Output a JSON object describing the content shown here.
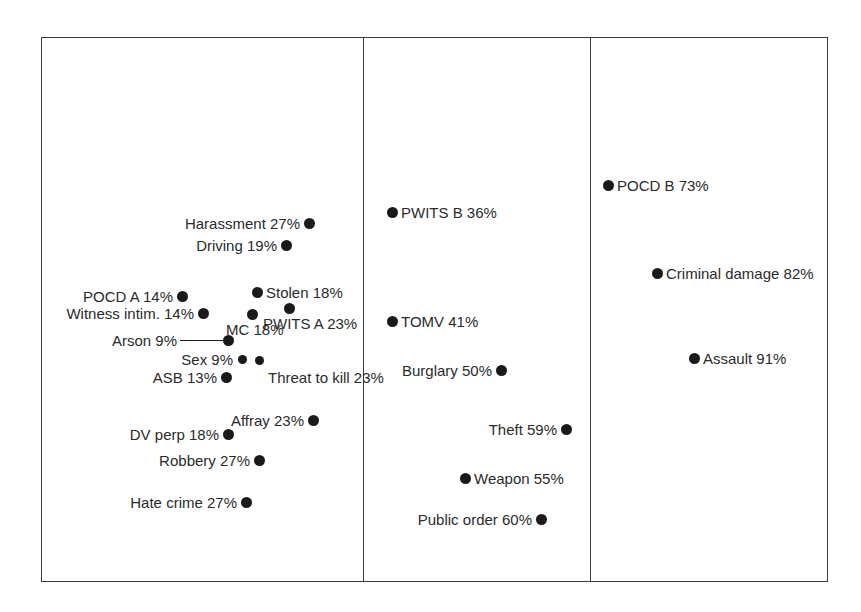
{
  "figure": {
    "background_color": "#ffffff",
    "frame_color": "#3b3b3b",
    "marker_color": "#1a1a1a",
    "text_color": "#2b2b2b"
  },
  "chart_data": {
    "type": "scatter",
    "title": "",
    "subtitle": "",
    "xlabel": "",
    "ylabel": "",
    "grid": false,
    "legend": "none",
    "panels": 3,
    "panel_dividers_x": [
      363,
      590
    ],
    "value_unit": "%",
    "note": "Labelled scatter of offence types against a percentage value; three vertical bands group low, medium and high percentages.",
    "points": [
      {
        "label": "Harassment 27%",
        "name": "Harassment",
        "value": 27,
        "panel": 1,
        "x": 309,
        "y": 223,
        "label_side": "left"
      },
      {
        "label": "Driving 19%",
        "name": "Driving",
        "value": 19,
        "panel": 1,
        "x": 286,
        "y": 245,
        "label_side": "left"
      },
      {
        "label": "POCD A 14%",
        "name": "POCD A",
        "value": 14,
        "panel": 1,
        "x": 182,
        "y": 296,
        "label_side": "left"
      },
      {
        "label": "Stolen 18%",
        "name": "Stolen",
        "value": 18,
        "panel": 1,
        "x": 257,
        "y": 292,
        "label_side": "right"
      },
      {
        "label": "Witness intim. 14%",
        "name": "Witness intim.",
        "value": 14,
        "panel": 1,
        "x": 203,
        "y": 313,
        "label_side": "left"
      },
      {
        "label": "PWITS A 23%",
        "name": "PWITS A",
        "value": 23,
        "panel": 1,
        "x": 289,
        "y": 308,
        "label_side": "below"
      },
      {
        "label": "MC 18%",
        "name": "MC",
        "value": 18,
        "panel": 1,
        "x": 252,
        "y": 314,
        "label_side": "below"
      },
      {
        "label": "Arson 9%",
        "name": "Arson",
        "value": 9,
        "panel": 1,
        "x": 228,
        "y": 340,
        "label_side": "leader"
      },
      {
        "label": "Sex 9%",
        "name": "Sex",
        "value": 9,
        "panel": 1,
        "x": 242,
        "y": 359,
        "label_side": "left"
      },
      {
        "label": "Threat to kill 23%",
        "name": "Threat to kill",
        "value": 23,
        "panel": 1,
        "x": 259,
        "y": 360,
        "label_side": "below-right"
      },
      {
        "label": "ASB 13%",
        "name": "ASB",
        "value": 13,
        "panel": 1,
        "x": 226,
        "y": 377,
        "label_side": "left"
      },
      {
        "label": "Affray 23%",
        "name": "Affray",
        "value": 23,
        "panel": 1,
        "x": 313,
        "y": 420,
        "label_side": "left"
      },
      {
        "label": "DV perp 18%",
        "name": "DV perp",
        "value": 18,
        "panel": 1,
        "x": 228,
        "y": 434,
        "label_side": "left"
      },
      {
        "label": "Robbery 27%",
        "name": "Robbery",
        "value": 27,
        "panel": 1,
        "x": 259,
        "y": 460,
        "label_side": "left"
      },
      {
        "label": "Hate crime 27%",
        "name": "Hate crime",
        "value": 27,
        "panel": 1,
        "x": 246,
        "y": 502,
        "label_side": "left"
      },
      {
        "label": "PWITS B 36%",
        "name": "PWITS B",
        "value": 36,
        "panel": 2,
        "x": 392,
        "y": 212,
        "label_side": "right"
      },
      {
        "label": "TOMV 41%",
        "name": "TOMV",
        "value": 41,
        "panel": 2,
        "x": 392,
        "y": 321,
        "label_side": "right"
      },
      {
        "label": "Burglary 50%",
        "name": "Burglary",
        "value": 50,
        "panel": 2,
        "x": 501,
        "y": 370,
        "label_side": "left"
      },
      {
        "label": "Theft 59%",
        "name": "Theft",
        "value": 59,
        "panel": 2,
        "x": 566,
        "y": 429,
        "label_side": "left"
      },
      {
        "label": "Weapon 55%",
        "name": "Weapon",
        "value": 55,
        "panel": 2,
        "x": 465,
        "y": 478,
        "label_side": "right"
      },
      {
        "label": "Public order 60%",
        "name": "Public order",
        "value": 60,
        "panel": 2,
        "x": 541,
        "y": 519,
        "label_side": "left"
      },
      {
        "label": "POCD B 73%",
        "name": "POCD B",
        "value": 73,
        "panel": 3,
        "x": 608,
        "y": 185,
        "label_side": "right"
      },
      {
        "label": "Criminal damage 82%",
        "name": "Criminal damage",
        "value": 82,
        "panel": 3,
        "x": 657,
        "y": 273,
        "label_side": "right"
      },
      {
        "label": "Assault 91%",
        "name": "Assault",
        "value": 91,
        "panel": 3,
        "x": 694,
        "y": 358,
        "label_side": "right"
      }
    ],
    "leader_line": {
      "for": "Arson 9%",
      "x1": 180,
      "x2": 224,
      "y": 340
    }
  }
}
